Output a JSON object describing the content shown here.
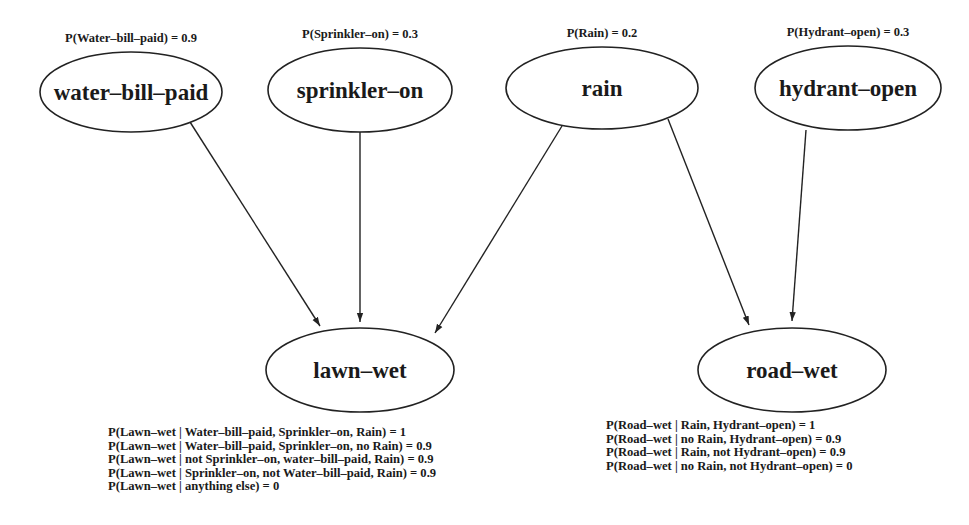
{
  "diagram": {
    "type": "bayesian-network",
    "nodes": [
      {
        "id": "water-bill-paid",
        "label": "water-bill-paid",
        "prior": "P(Water-bill-paid) = 0.9",
        "cx": 131,
        "cy": 92,
        "rx": 91,
        "ry": 40
      },
      {
        "id": "sprinkler-on",
        "label": "sprinkler-on",
        "prior": "P(Sprinkler-on) = 0.3",
        "cx": 360,
        "cy": 90,
        "rx": 92,
        "ry": 42
      },
      {
        "id": "rain",
        "label": "rain",
        "prior": "P(Rain) = 0.2",
        "cx": 602,
        "cy": 88,
        "rx": 96,
        "ry": 41
      },
      {
        "id": "hydrant-open",
        "label": "hydrant-open",
        "prior": "P(Hydrant-open) = 0.3",
        "cx": 848,
        "cy": 88,
        "rx": 93,
        "ry": 42
      },
      {
        "id": "lawn-wet",
        "label": "lawn-wet",
        "cx": 360,
        "cy": 370,
        "rx": 94,
        "ry": 42
      },
      {
        "id": "road-wet",
        "label": "road-wet",
        "cx": 792,
        "cy": 370,
        "rx": 94,
        "ry": 42
      }
    ],
    "edges": [
      {
        "from": "water-bill-paid",
        "to": "lawn-wet",
        "x1": 190,
        "y1": 122,
        "x2": 320,
        "y2": 326
      },
      {
        "from": "sprinkler-on",
        "to": "lawn-wet",
        "x1": 360,
        "y1": 132,
        "x2": 360,
        "y2": 322
      },
      {
        "from": "rain",
        "to": "lawn-wet",
        "x1": 562,
        "y1": 126,
        "x2": 435,
        "y2": 333
      },
      {
        "from": "rain",
        "to": "road-wet",
        "x1": 668,
        "y1": 119,
        "x2": 749,
        "y2": 325
      },
      {
        "from": "hydrant-open",
        "to": "road-wet",
        "x1": 806,
        "y1": 130,
        "x2": 792,
        "y2": 321
      }
    ],
    "cpt_lawn_wet": [
      "P(Lawn–wet | Water–bill–paid, Sprinkler–on, Rain) = 1",
      "P(Lawn–wet | Water–bill–paid, Sprinkler–on, no Rain) = 0.9",
      "P(Lawn–wet | not Sprinkler–on, water–bill–paid, Rain) = 0.9",
      "P(Lawn–wet | Sprinkler–on, not Water–bill–paid, Rain) = 0.9",
      "P(Lawn–wet | anything else) = 0"
    ],
    "cpt_road_wet": [
      "P(Road–wet | Rain, Hydrant–open) = 1",
      "P(Road–wet | no Rain, Hydrant–open) = 0.9",
      "P(Road–wet | Rain, not Hydrant–open) = 0.9",
      "P(Road–wet | no Rain, not Hydrant–open) = 0"
    ],
    "colors": {
      "stroke": "#222222",
      "text": "#1a1a1a",
      "background": "#ffffff"
    }
  }
}
